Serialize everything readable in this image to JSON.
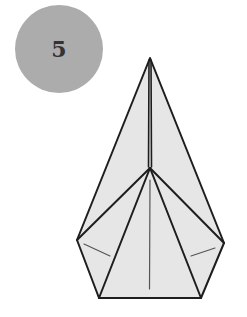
{
  "step": {
    "number": "5",
    "badge_color": "#acacac",
    "text_color": "#333333"
  },
  "diagram": {
    "paper_fill": "#e6e6e6",
    "outline_color": "#1e1e1e",
    "crease_color": "#555555"
  }
}
